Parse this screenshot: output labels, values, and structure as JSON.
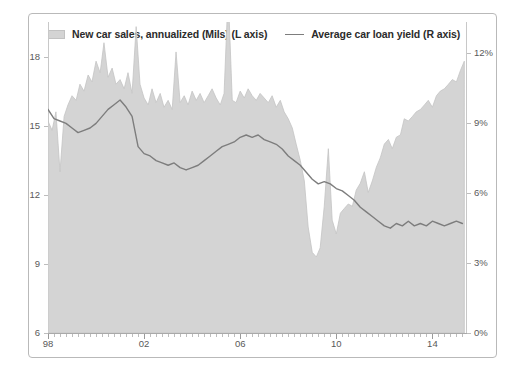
{
  "legend": {
    "entries": [
      {
        "icon": "area-swatch-icon",
        "label": "New car sales, annualized (Mils) (L axis)"
      },
      {
        "icon": "line-swatch-icon",
        "label": "Average car loan yield  (R axis)"
      }
    ]
  },
  "axes": {
    "left_ticks": [
      "18",
      "15",
      "12",
      "9",
      "6"
    ],
    "right_ticks": [
      "12%",
      "9%",
      "6%",
      "3%",
      "0%"
    ],
    "bottom_ticks": [
      "98",
      "02",
      "06",
      "10",
      "14"
    ]
  },
  "colors": {
    "area_fill": "#d4d4d4",
    "area_stroke": "#c4c4c4",
    "line": "#7d7d7d",
    "frame": "#b9b9b9",
    "axis": "#c8c8c8",
    "tick_text": "#595959",
    "legend_text": "#2b2b2b",
    "background": "#ffffff"
  },
  "chart_data": {
    "type": "area",
    "title": "",
    "subtitle": "",
    "xlabel": "",
    "ylabel": "",
    "y2label": "",
    "grid": false,
    "legend_position": "top",
    "xlim": [
      1998.0,
      2015.4
    ],
    "ylim": [
      6,
      19.5
    ],
    "y2lim": [
      0,
      13.35
    ],
    "x_tick_values": [
      1998,
      2002,
      2006,
      2010,
      2014
    ],
    "x_tick_labels": [
      "98",
      "02",
      "06",
      "10",
      "14"
    ],
    "y_tick_values": [
      6,
      9,
      12,
      15,
      18
    ],
    "y_tick_labels": [
      "6",
      "9",
      "12",
      "15",
      "18"
    ],
    "y2_tick_values": [
      0,
      3,
      6,
      9,
      12
    ],
    "y2_tick_labels": [
      "0%",
      "3%",
      "6%",
      "9%",
      "12%"
    ],
    "series": [
      {
        "name": "New car sales, annualized (Mils) (L axis)",
        "type": "area",
        "axis": "left",
        "units": "Mils",
        "color": "#d4d4d4",
        "x": [
          1998.0,
          1998.17,
          1998.33,
          1998.5,
          1998.67,
          1998.83,
          1999.0,
          1999.17,
          1999.33,
          1999.5,
          1999.67,
          1999.83,
          2000.0,
          2000.17,
          2000.33,
          2000.5,
          2000.67,
          2000.83,
          2001.0,
          2001.17,
          2001.33,
          2001.5,
          2001.67,
          2001.83,
          2002.0,
          2002.17,
          2002.33,
          2002.5,
          2002.67,
          2002.83,
          2003.0,
          2003.17,
          2003.33,
          2003.5,
          2003.67,
          2003.83,
          2004.0,
          2004.17,
          2004.33,
          2004.5,
          2004.67,
          2004.83,
          2005.0,
          2005.17,
          2005.33,
          2005.5,
          2005.67,
          2005.83,
          2006.0,
          2006.17,
          2006.33,
          2006.5,
          2006.67,
          2006.83,
          2007.0,
          2007.17,
          2007.33,
          2007.5,
          2007.67,
          2007.83,
          2008.0,
          2008.17,
          2008.33,
          2008.5,
          2008.67,
          2008.83,
          2009.0,
          2009.17,
          2009.33,
          2009.5,
          2009.67,
          2009.83,
          2010.0,
          2010.17,
          2010.33,
          2010.5,
          2010.67,
          2010.83,
          2011.0,
          2011.17,
          2011.33,
          2011.5,
          2011.67,
          2011.83,
          2012.0,
          2012.17,
          2012.33,
          2012.5,
          2012.67,
          2012.83,
          2013.0,
          2013.17,
          2013.33,
          2013.5,
          2013.67,
          2013.83,
          2014.0,
          2014.17,
          2014.33,
          2014.5,
          2014.67,
          2014.83,
          2015.0,
          2015.17,
          2015.33
        ],
        "values": [
          15.2,
          14.8,
          15.6,
          13.0,
          15.4,
          15.9,
          16.3,
          16.1,
          16.8,
          16.5,
          17.2,
          16.9,
          17.8,
          17.3,
          18.6,
          17.1,
          17.5,
          16.8,
          17.0,
          16.6,
          17.3,
          16.4,
          19.3,
          16.8,
          16.2,
          15.9,
          16.6,
          16.0,
          16.4,
          15.8,
          16.1,
          15.7,
          18.2,
          16.0,
          16.3,
          15.9,
          16.5,
          16.1,
          16.4,
          16.0,
          16.3,
          16.6,
          16.2,
          15.9,
          16.4,
          20.8,
          16.1,
          16.0,
          16.5,
          16.2,
          16.6,
          16.3,
          16.1,
          16.4,
          16.2,
          16.0,
          16.3,
          15.8,
          16.1,
          15.6,
          15.3,
          14.9,
          14.2,
          13.5,
          12.6,
          10.6,
          9.5,
          9.3,
          9.7,
          11.5,
          14.0,
          10.9,
          10.3,
          11.2,
          11.4,
          11.6,
          11.5,
          12.2,
          12.5,
          13.0,
          12.1,
          12.6,
          13.2,
          13.6,
          14.2,
          14.4,
          14.0,
          14.5,
          14.6,
          15.3,
          15.2,
          15.4,
          15.6,
          15.7,
          15.9,
          16.1,
          15.8,
          16.3,
          16.5,
          16.6,
          16.8,
          17.0,
          16.9,
          17.4,
          17.8
        ]
      },
      {
        "name": "Average car loan yield  (R axis)",
        "type": "line",
        "axis": "right",
        "units": "%",
        "color": "#7d7d7d",
        "x": [
          1998.0,
          1998.25,
          1998.5,
          1998.75,
          1999.0,
          1999.25,
          1999.5,
          1999.75,
          2000.0,
          2000.25,
          2000.5,
          2000.75,
          2001.0,
          2001.25,
          2001.5,
          2001.75,
          2002.0,
          2002.25,
          2002.5,
          2002.75,
          2003.0,
          2003.25,
          2003.5,
          2003.75,
          2004.0,
          2004.25,
          2004.5,
          2004.75,
          2005.0,
          2005.25,
          2005.5,
          2005.75,
          2006.0,
          2006.25,
          2006.5,
          2006.75,
          2007.0,
          2007.25,
          2007.5,
          2007.75,
          2008.0,
          2008.25,
          2008.5,
          2008.75,
          2009.0,
          2009.25,
          2009.5,
          2009.75,
          2010.0,
          2010.25,
          2010.5,
          2010.75,
          2011.0,
          2011.25,
          2011.5,
          2011.75,
          2012.0,
          2012.25,
          2012.5,
          2012.75,
          2013.0,
          2013.25,
          2013.5,
          2013.75,
          2014.0,
          2014.25,
          2014.5,
          2014.75,
          2015.0,
          2015.25
        ],
        "values": [
          9.6,
          9.2,
          9.1,
          9.0,
          8.8,
          8.6,
          8.7,
          8.8,
          9.0,
          9.3,
          9.6,
          9.8,
          10.0,
          9.7,
          9.3,
          8.0,
          7.7,
          7.6,
          7.4,
          7.3,
          7.2,
          7.3,
          7.1,
          7.0,
          7.1,
          7.2,
          7.4,
          7.6,
          7.8,
          8.0,
          8.1,
          8.2,
          8.4,
          8.5,
          8.4,
          8.5,
          8.3,
          8.2,
          8.1,
          7.9,
          7.6,
          7.4,
          7.2,
          6.9,
          6.6,
          6.4,
          6.5,
          6.4,
          6.2,
          6.1,
          5.9,
          5.7,
          5.4,
          5.2,
          5.0,
          4.8,
          4.6,
          4.5,
          4.7,
          4.6,
          4.8,
          4.6,
          4.7,
          4.6,
          4.8,
          4.7,
          4.6,
          4.7,
          4.8,
          4.7
        ]
      }
    ]
  }
}
